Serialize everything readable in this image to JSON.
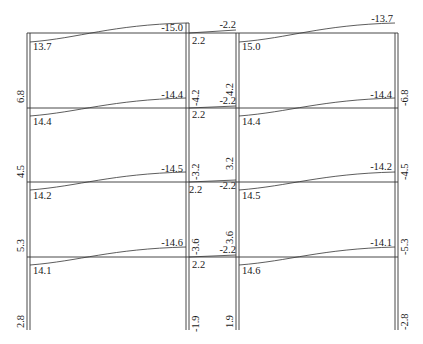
{
  "diagram": {
    "type": "bending-moment-diagram",
    "structure": "3-bay 4-storey frame (two outer bays, narrow middle corridor bay)",
    "colors": {
      "line": "#333333",
      "text": "#1a1a1a",
      "background": "#ffffff"
    },
    "floors": [
      {
        "level": "roof",
        "left_beam": {
          "left_end": "13.7",
          "right_end": "-15.0"
        },
        "middle_beam": {
          "left_end": "2.2",
          "right_end": "-2.2"
        },
        "right_beam": {
          "left_end": "15.0",
          "right_end": "-13.7"
        }
      },
      {
        "level": "3",
        "left_beam": {
          "left_end": "14.4",
          "right_end": "-14.4"
        },
        "middle_beam": {
          "left_end": "2.2",
          "right_end": "-2.2"
        },
        "right_beam": {
          "left_end": "14.4",
          "right_end": "-14.4"
        }
      },
      {
        "level": "2",
        "left_beam": {
          "left_end": "14.2",
          "right_end": "-14.5"
        },
        "middle_beam": {
          "left_end": "2.2",
          "right_end": "-2.2"
        },
        "right_beam": {
          "left_end": "14.5",
          "right_end": "-14.2"
        }
      },
      {
        "level": "1",
        "left_beam": {
          "left_end": "14.1",
          "right_end": "-14.6"
        },
        "middle_beam": {
          "left_end": "2.2",
          "right_end": "-2.2"
        },
        "right_beam": {
          "left_end": "14.6",
          "right_end": "-14.1"
        }
      }
    ],
    "columns": {
      "left_outer": [
        "6.8",
        "4.5",
        "5.3",
        "2.8"
      ],
      "left_inner": [
        "-4.2",
        "-3.2",
        "-3.6",
        "-1.9"
      ],
      "right_inner": [
        "4.2",
        "3.2",
        "3.6",
        "1.9"
      ],
      "right_outer": [
        "-6.8",
        "-4.5",
        "-5.3",
        "-2.8"
      ]
    }
  }
}
